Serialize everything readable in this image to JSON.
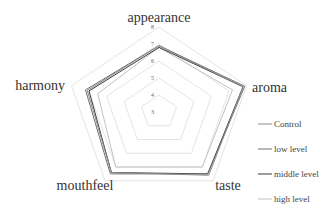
{
  "chart_data": {
    "type": "radar",
    "title": "",
    "axes": [
      "appearance",
      "aroma",
      "taste",
      "mouthfeel",
      "harmony"
    ],
    "scale": {
      "min": 3,
      "max": 8,
      "ticks": [
        3,
        4,
        5,
        6,
        7,
        8
      ]
    },
    "grid": true,
    "legend_position": "right",
    "series": [
      {
        "name": "Control",
        "color": "#8a8a8a",
        "width": 1.0,
        "values": [
          6.9,
          7.8,
          7.6,
          7.4,
          7.1
        ]
      },
      {
        "name": "low level",
        "color": "#6f6f6f",
        "width": 1.0,
        "values": [
          6.9,
          7.9,
          7.5,
          7.5,
          7.2
        ]
      },
      {
        "name": "middle level",
        "color": "#3a3a3a",
        "width": 1.0,
        "values": [
          6.8,
          7.8,
          7.5,
          7.4,
          7.0
        ]
      },
      {
        "name": "high level",
        "color": "#c2c2c2",
        "width": 1.0,
        "values": [
          6.8,
          7.2,
          7.0,
          7.0,
          6.5
        ]
      }
    ]
  },
  "layout": {
    "center": [
      159,
      112
    ],
    "radius_y": 85,
    "radius_x": 92,
    "grid_color": "#dddddd"
  }
}
